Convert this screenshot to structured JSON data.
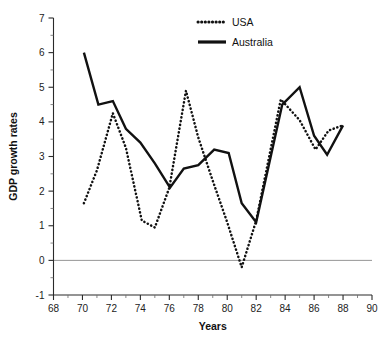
{
  "chart_data": {
    "type": "line",
    "title": "",
    "xlabel": "Years",
    "ylabel": "GDP growth rates",
    "xlim": [
      68,
      90
    ],
    "ylim": [
      -1,
      7
    ],
    "grid": false,
    "legend_position": "top-center",
    "x_major_ticks": [
      68,
      70,
      72,
      74,
      76,
      78,
      80,
      82,
      84,
      86,
      88,
      90
    ],
    "x_minor_ticks": [
      69,
      71,
      73,
      75,
      77,
      79,
      81,
      83,
      85,
      87,
      89
    ],
    "y_major_ticks": [
      -1,
      0,
      1,
      2,
      3,
      4,
      5,
      6,
      7
    ],
    "y_minor_ticks": [
      -0.5,
      0.5,
      1.5,
      2.5,
      3.5,
      4.5,
      5.5,
      6.5
    ],
    "x_tick_labels": [
      "68",
      "70",
      "72",
      "74",
      "76",
      "78",
      "80",
      "82",
      "84",
      "86",
      "88",
      "90"
    ],
    "y_tick_labels": [
      "-1",
      "0",
      "1",
      "2",
      "3",
      "4",
      "5",
      "6",
      "7"
    ],
    "zero_reference_line": 0,
    "series": [
      {
        "name": "USA",
        "style": "dotted",
        "color": "#111111",
        "x": [
          70.1,
          71.0,
          72.1,
          73.0,
          74.1,
          75.0,
          76.0,
          77.15,
          78.0,
          79.0,
          80.0,
          81.0,
          82.0,
          83.7,
          85.0,
          86.1,
          87.0,
          88.0
        ],
        "values": [
          1.65,
          2.6,
          4.25,
          3.25,
          1.15,
          0.95,
          2.1,
          4.9,
          3.55,
          2.3,
          1.1,
          -0.2,
          1.15,
          4.65,
          4.05,
          3.2,
          3.75,
          3.9
        ]
      },
      {
        "name": "Australia",
        "style": "solid",
        "color": "#111111",
        "x": [
          70.1,
          71.1,
          72.1,
          73.0,
          74.0,
          75.0,
          76.05,
          77.0,
          78.0,
          79.1,
          80.1,
          81.0,
          82.0,
          83.8,
          85.0,
          86.0,
          86.9,
          88.0
        ],
        "values": [
          6.0,
          4.5,
          4.6,
          3.8,
          3.4,
          2.8,
          2.1,
          2.65,
          2.75,
          3.2,
          3.1,
          1.65,
          1.1,
          4.5,
          5.0,
          3.6,
          3.05,
          3.9
        ]
      }
    ]
  },
  "legend": {
    "items": [
      {
        "label": "USA",
        "style": "dotted"
      },
      {
        "label": "Australia",
        "style": "solid"
      }
    ]
  },
  "axes": {
    "x_title": "Years",
    "y_title": "GDP growth rates"
  }
}
